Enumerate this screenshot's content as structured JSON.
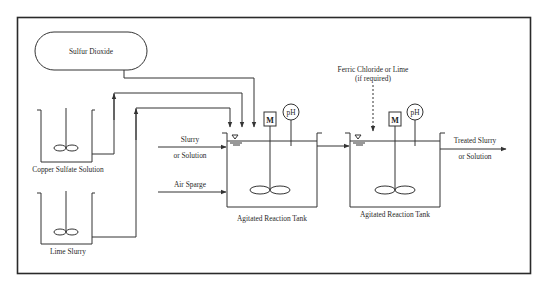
{
  "diagram": {
    "type": "process_flow",
    "nodes": {
      "sulfur_dioxide": {
        "label": "Sulfur Dioxide"
      },
      "copper_sulfate": {
        "label": "Copper Sulfate Solution"
      },
      "lime_slurry": {
        "label": "Lime Slurry"
      },
      "reaction_tank_1": {
        "label": "Agitated Reaction Tank",
        "motor": "M",
        "ph": "pH"
      },
      "reaction_tank_2": {
        "label": "Agitated Reaction Tank",
        "motor": "M",
        "ph": "pH"
      }
    },
    "inputs": {
      "slurry_line1": "Slurry",
      "slurry_line2": "or Solution",
      "air_sparge": "Air Sparge",
      "ferric_line1": "Ferric Chloride or Lime",
      "ferric_line2": "(if required)"
    },
    "outputs": {
      "treated_line1": "Treated Slurry",
      "treated_line2": "or Solution"
    },
    "edges": [
      {
        "from": "Sulfur Dioxide",
        "to": "Agitated Reaction Tank 1"
      },
      {
        "from": "Copper Sulfate Solution",
        "to": "Agitated Reaction Tank 1"
      },
      {
        "from": "Lime Slurry",
        "to": "Agitated Reaction Tank 1"
      },
      {
        "from": "Slurry or Solution",
        "to": "Agitated Reaction Tank 1"
      },
      {
        "from": "Air Sparge",
        "to": "Agitated Reaction Tank 1"
      },
      {
        "from": "Agitated Reaction Tank 1",
        "to": "Agitated Reaction Tank 2"
      },
      {
        "from": "Ferric Chloride or Lime (if required)",
        "to": "Agitated Reaction Tank 2",
        "style": "dashed"
      },
      {
        "from": "Agitated Reaction Tank 2",
        "to": "Treated Slurry or Solution"
      }
    ]
  }
}
